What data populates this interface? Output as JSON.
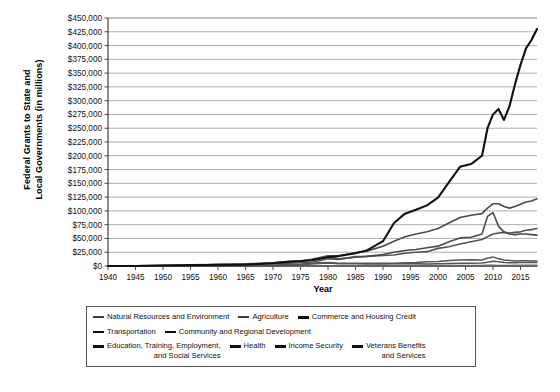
{
  "chart_data": {
    "type": "line",
    "title": "",
    "xlabel": "Year",
    "ylabel": "Federal Grants to State and Local Governments (in millions)",
    "ylabel_line1": "Federal Grants to State and",
    "ylabel_line2": "Local Governments (in millions)",
    "xlim": [
      1940,
      2018
    ],
    "ylim": [
      0,
      450000
    ],
    "grid": true,
    "legend_position": "bottom",
    "ytick_labels": [
      "$0",
      "$25,000",
      "$50,000",
      "$75,000",
      "$100,000",
      "$125,000",
      "$150,000",
      "$175,000",
      "$200,000",
      "$225,000",
      "$250,000",
      "$275,000",
      "$300,000",
      "$325,000",
      "$350,000",
      "$375,000",
      "$400,000",
      "$425,000",
      "$450,000"
    ],
    "ytick_values": [
      0,
      25000,
      50000,
      75000,
      100000,
      125000,
      150000,
      175000,
      200000,
      225000,
      250000,
      275000,
      300000,
      325000,
      350000,
      375000,
      400000,
      425000,
      450000
    ],
    "xtick_labels": [
      "1940",
      "1945",
      "1950",
      "1955",
      "1960",
      "1965",
      "1970",
      "1975",
      "1980",
      "1985",
      "1990",
      "1995",
      "2000",
      "2005",
      "2010",
      "2015"
    ],
    "xtick_values": [
      1940,
      1945,
      1950,
      1955,
      1960,
      1965,
      1970,
      1975,
      1980,
      1985,
      1990,
      1995,
      2000,
      2005,
      2010,
      2015
    ],
    "x": [
      1940,
      1945,
      1950,
      1955,
      1960,
      1965,
      1970,
      1973,
      1975,
      1977,
      1980,
      1982,
      1985,
      1987,
      1990,
      1992,
      1994,
      1996,
      1998,
      2000,
      2002,
      2004,
      2006,
      2008,
      2009,
      2010,
      2011,
      2012,
      2013,
      2014,
      2015,
      2016,
      2017,
      2018
    ],
    "series": [
      {
        "name": "Health",
        "color": "#111111",
        "width": 2.1,
        "values": [
          30,
          70,
          900,
          1500,
          2000,
          2800,
          5000,
          8000,
          9000,
          10500,
          15800,
          18000,
          23000,
          28000,
          45000,
          78000,
          95000,
          102000,
          110000,
          124000,
          152000,
          180000,
          185000,
          200000,
          250000,
          275000,
          285000,
          265000,
          290000,
          330000,
          365000,
          395000,
          410000,
          430000
        ]
      },
      {
        "name": "Income Security",
        "color": "#4a4a4a",
        "width": 1.6,
        "values": [
          300,
          500,
          1400,
          1500,
          2100,
          2700,
          5800,
          8200,
          9000,
          12000,
          18500,
          18500,
          24000,
          27000,
          36000,
          45000,
          53000,
          58000,
          62000,
          68000,
          78000,
          88000,
          92000,
          95000,
          105000,
          113000,
          113000,
          108000,
          105000,
          108000,
          112000,
          116000,
          118000,
          122000
        ]
      },
      {
        "name": "Education, Training, Employment, and Social Services",
        "color": "#4a4a4a",
        "width": 1.6,
        "values": [
          150,
          180,
          300,
          500,
          800,
          1200,
          5800,
          7000,
          8500,
          10000,
          17000,
          13000,
          16000,
          17500,
          21000,
          25000,
          28000,
          30000,
          33000,
          36000,
          44000,
          51000,
          52000,
          58000,
          90000,
          97000,
          72000,
          62000,
          58000,
          57000,
          58000,
          58000,
          57000,
          56000
        ]
      },
      {
        "name": "Transportation",
        "color": "#555555",
        "width": 1.6,
        "values": [
          180,
          100,
          450,
          700,
          2900,
          4100,
          4600,
          5100,
          5900,
          6400,
          13000,
          12000,
          17000,
          17500,
          19000,
          20000,
          23000,
          25000,
          26000,
          32000,
          35000,
          40000,
          44000,
          48000,
          53000,
          58000,
          60000,
          61000,
          60000,
          61000,
          62000,
          65000,
          66000,
          68000
        ]
      },
      {
        "name": "Natural Resources and Environment",
        "color": "#555555",
        "width": 1.5,
        "values": [
          30,
          20,
          70,
          80,
          110,
          200,
          400,
          1200,
          2400,
          3800,
          5400,
          4000,
          4100,
          3500,
          3700,
          3900,
          4100,
          3900,
          3700,
          4300,
          4500,
          5000,
          5200,
          5600,
          7000,
          8600,
          7600,
          6500,
          6000,
          6000,
          6200,
          6300,
          6300,
          6500
        ]
      },
      {
        "name": "Community and Regional Development",
        "color": "#555555",
        "width": 1.5,
        "values": [
          20,
          30,
          50,
          80,
          100,
          300,
          1800,
          2600,
          3000,
          5400,
          6500,
          5000,
          5200,
          5000,
          5000,
          5000,
          6000,
          6500,
          7500,
          8000,
          10000,
          11000,
          11500,
          11000,
          14000,
          16500,
          13000,
          11000,
          10000,
          9000,
          9500,
          9500,
          9000,
          9000
        ]
      },
      {
        "name": "Commerce and Housing Credit",
        "color": "#666666",
        "width": 1.4,
        "values": [
          10,
          10,
          20,
          20,
          30,
          40,
          50,
          60,
          80,
          100,
          150,
          130,
          120,
          110,
          100,
          90,
          90,
          80,
          80,
          80,
          90,
          90,
          100,
          120,
          160,
          200,
          180,
          160,
          150,
          140,
          140,
          140,
          140,
          140
        ]
      },
      {
        "name": "Agriculture",
        "color": "#666666",
        "width": 1.4,
        "values": [
          100,
          50,
          60,
          70,
          90,
          150,
          300,
          350,
          400,
          500,
          700,
          600,
          700,
          900,
          900,
          800,
          800,
          800,
          900,
          900,
          1000,
          1000,
          1000,
          1000,
          1300,
          1400,
          1200,
          1000,
          900,
          900,
          900,
          900,
          900,
          900
        ]
      },
      {
        "name": "Veterans Benefits and Services",
        "color": "#666666",
        "width": 1.4,
        "values": [
          5,
          10,
          20,
          30,
          40,
          50,
          60,
          70,
          80,
          90,
          100,
          110,
          120,
          130,
          140,
          150,
          160,
          170,
          180,
          200,
          250,
          300,
          350,
          400,
          500,
          600,
          650,
          700,
          750,
          800,
          850,
          900,
          950,
          1000
        ]
      }
    ]
  },
  "legend": {
    "rows": [
      [
        {
          "label": "Natural Resources and Environment",
          "thick": false
        },
        {
          "label": "Agriculture",
          "thick": false
        },
        {
          "label": "Commerce and Housing Credit",
          "thick": true
        }
      ],
      [
        {
          "label": "Transportation",
          "thick": true
        },
        {
          "label": "Community and Regional Development",
          "thick": true
        }
      ],
      [
        {
          "label": "Education, Training, Employment,",
          "label2": "and Social Services",
          "thick": true
        },
        {
          "label": "Health",
          "thick": true
        },
        {
          "label": "Income Security",
          "thick": true
        },
        {
          "label": "Veterans Benefits",
          "label2": "and Services",
          "thick": true
        }
      ]
    ]
  }
}
